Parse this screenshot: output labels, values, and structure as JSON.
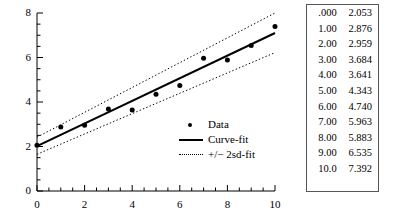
{
  "chart_data": {
    "type": "scatter",
    "title": "",
    "xlabel": "",
    "ylabel": "",
    "xlim": [
      0,
      10
    ],
    "ylim": [
      0,
      8
    ],
    "x_ticks": [
      "0",
      "2",
      "4",
      "6",
      "8",
      "10"
    ],
    "x_tick_values": [
      0,
      2,
      4,
      6,
      8,
      10
    ],
    "x_minor_step": 0.5,
    "y_ticks": [
      "0",
      "2",
      "4",
      "6",
      "8"
    ],
    "y_tick_values": [
      0,
      2,
      4,
      6,
      8
    ],
    "y_minor_step": 0.5,
    "grid": false,
    "legend_position": "center-right-inside",
    "x": [
      0,
      1,
      2,
      3,
      4,
      5,
      6,
      7,
      8,
      9,
      10
    ],
    "series": [
      {
        "name": "Data",
        "type": "scatter",
        "marker": "filled-circle",
        "values": [
          2.053,
          2.876,
          2.959,
          3.684,
          3.641,
          4.343,
          4.74,
          5.963,
          5.883,
          6.535,
          7.392
        ]
      },
      {
        "name": "Curve-fit",
        "type": "line",
        "style": "solid",
        "endpoints": [
          {
            "x": 0,
            "y": 2.02
          },
          {
            "x": 10,
            "y": 7.1
          }
        ]
      },
      {
        "name": "+/- 2sd-fit upper",
        "type": "line",
        "style": "dotted",
        "endpoints": [
          {
            "x": 0,
            "y": 2.42
          },
          {
            "x": 10,
            "y": 8.0
          }
        ]
      },
      {
        "name": "+/- 2sd-fit lower",
        "type": "line",
        "style": "dotted",
        "endpoints": [
          {
            "x": 0,
            "y": 1.65
          },
          {
            "x": 10,
            "y": 6.22
          }
        ]
      }
    ]
  },
  "legend": {
    "items": [
      {
        "label": "Data",
        "key": "filled-circle-marker"
      },
      {
        "label": "Curve-fit",
        "key": "solid-line"
      },
      {
        "label": "+/− 2sd-fit",
        "key": "dotted-line"
      }
    ]
  },
  "table": {
    "columns": [
      "x",
      "y"
    ],
    "rows": [
      {
        "x": ".000",
        "y": "2.053"
      },
      {
        "x": "1.00",
        "y": "2.876"
      },
      {
        "x": "2.00",
        "y": "2.959"
      },
      {
        "x": "3.00",
        "y": "3.684"
      },
      {
        "x": "4.00",
        "y": "3.641"
      },
      {
        "x": "5.00",
        "y": "4.343"
      },
      {
        "x": "6.00",
        "y": "4.740"
      },
      {
        "x": "7.00",
        "y": "5.963"
      },
      {
        "x": "8.00",
        "y": "5.883"
      },
      {
        "x": "9.00",
        "y": "6.535"
      },
      {
        "x": "10.0",
        "y": "7.392"
      }
    ]
  },
  "colors": {
    "ink": "#000000",
    "table_border": "#555555",
    "background": "#ffffff"
  }
}
